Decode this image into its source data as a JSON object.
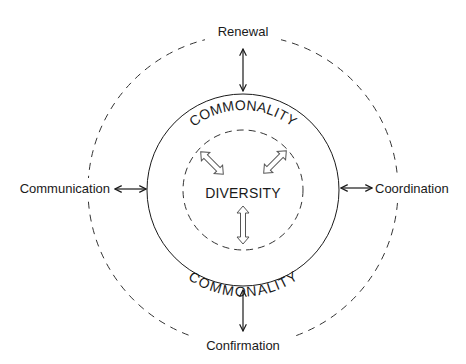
{
  "diagram": {
    "outer_labels": {
      "top": "Renewal",
      "left": "Communication",
      "right": "Coordination",
      "bottom": "Confirmation"
    },
    "ring_labels": {
      "top": "COMMONALITY",
      "bottom": "COMMONALITY"
    },
    "center_label": "DIVERSITY",
    "colors": {
      "stroke": "#1a1a1a",
      "dashed": "#333333",
      "hollow_arrow": "#555555",
      "background": "#ffffff"
    }
  }
}
